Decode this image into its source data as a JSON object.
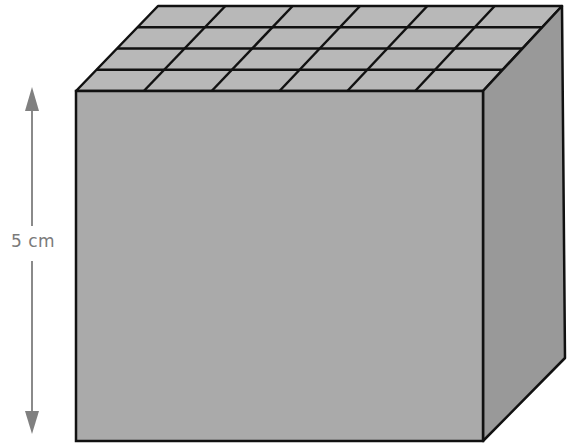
{
  "diagram": {
    "type": "rectangular-prism-unit-cubes",
    "dimension_label": "5 cm",
    "top_grid": {
      "columns": 6,
      "rows": 4
    },
    "colors": {
      "front_face": "#aaaaaa",
      "side_face": "#999999",
      "top_face": "#b8b8b8",
      "edge": "#111111",
      "arrow": "#888888",
      "label": "#7a7a7a"
    }
  }
}
